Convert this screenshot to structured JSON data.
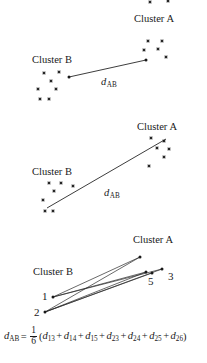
{
  "figure": {
    "title": "",
    "background_color": "#ffffff",
    "ink_color": "#1a1a1a",
    "width": 207,
    "height": 363
  },
  "panels": [
    {
      "id": "panel-single-linkage",
      "cluster_a_label": "Cluster A",
      "cluster_b_label": "Cluster B",
      "distance_symbol": "d",
      "distance_subscript": "AB",
      "linkage_type": "nearest-neighbour",
      "cluster_a_points": [
        {
          "x": 148,
          "y": 41
        },
        {
          "x": 162,
          "y": 41
        },
        {
          "x": 144,
          "y": 50
        },
        {
          "x": 158,
          "y": 49
        },
        {
          "x": 166,
          "y": 57
        }
      ],
      "cluster_b_points": [
        {
          "x": 44,
          "y": 73
        },
        {
          "x": 59,
          "y": 72
        },
        {
          "x": 51,
          "y": 81
        },
        {
          "x": 38,
          "y": 89
        },
        {
          "x": 56,
          "y": 89
        },
        {
          "x": 40,
          "y": 99
        },
        {
          "x": 49,
          "y": 99
        }
      ],
      "links": [
        {
          "from": {
            "x": 69,
            "y": 77
          },
          "to": {
            "x": 146,
            "y": 60
          }
        }
      ],
      "label_positions": {
        "cluster_a": {
          "x": 134,
          "y": 22
        },
        "cluster_b": {
          "x": 32,
          "y": 63
        },
        "distance": {
          "x": 101,
          "y": 85
        }
      }
    },
    {
      "id": "panel-complete-linkage",
      "cluster_a_label": "Cluster A",
      "cluster_b_label": "Cluster B",
      "distance_symbol": "d",
      "distance_subscript": "AB",
      "linkage_type": "furthest-neighbour",
      "cluster_a_points": [
        {
          "x": 151,
          "y": 138
        },
        {
          "x": 164,
          "y": 141
        },
        {
          "x": 157,
          "y": 148
        },
        {
          "x": 169,
          "y": 149
        },
        {
          "x": 164,
          "y": 157
        },
        {
          "x": 149,
          "y": 166
        }
      ],
      "cluster_b_points": [
        {
          "x": 49,
          "y": 183
        },
        {
          "x": 61,
          "y": 183
        },
        {
          "x": 73,
          "y": 186
        },
        {
          "x": 54,
          "y": 191
        },
        {
          "x": 43,
          "y": 200
        },
        {
          "x": 45,
          "y": 211
        },
        {
          "x": 53,
          "y": 211
        }
      ],
      "links": [
        {
          "from": {
            "x": 47,
            "y": 208
          },
          "to": {
            "x": 166,
            "y": 139
          }
        }
      ],
      "label_positions": {
        "cluster_a": {
          "x": 137,
          "y": 130
        },
        "cluster_b": {
          "x": 32,
          "y": 175
        },
        "distance": {
          "x": 104,
          "y": 196
        }
      }
    },
    {
      "id": "panel-average-linkage",
      "cluster_a_label": "Cluster A",
      "cluster_b_label": "Cluster B",
      "linkage_type": "average-linkage",
      "cluster_a_points": [
        {
          "id": "3",
          "x": 162,
          "y": 269
        },
        {
          "id": "4",
          "x": 140,
          "y": 257
        },
        {
          "id": "5",
          "x": 146,
          "y": 272
        },
        {
          "id": "6",
          "x": 152,
          "y": 273
        }
      ],
      "cluster_b_points": [
        {
          "id": "1",
          "x": 53,
          "y": 297
        },
        {
          "id": "2",
          "x": 45,
          "y": 312
        }
      ],
      "point_labels": [
        {
          "text": "1",
          "x": 42,
          "y": 300
        },
        {
          "text": "2",
          "x": 34,
          "y": 316
        },
        {
          "text": "3",
          "x": 168,
          "y": 280
        },
        {
          "text": "5",
          "x": 148,
          "y": 285
        }
      ],
      "links": [
        {
          "from_id": "1",
          "to_id": "3",
          "from": {
            "x": 53,
            "y": 297
          },
          "to": {
            "x": 162,
            "y": 269
          }
        },
        {
          "from_id": "1",
          "to_id": "4",
          "from": {
            "x": 53,
            "y": 297
          },
          "to": {
            "x": 140,
            "y": 257
          }
        },
        {
          "from_id": "1",
          "to_id": "5",
          "from": {
            "x": 53,
            "y": 297
          },
          "to": {
            "x": 146,
            "y": 272
          }
        },
        {
          "from_id": "2",
          "to_id": "3",
          "from": {
            "x": 45,
            "y": 312
          },
          "to": {
            "x": 162,
            "y": 269
          }
        },
        {
          "from_id": "2",
          "to_id": "4",
          "from": {
            "x": 45,
            "y": 312
          },
          "to": {
            "x": 140,
            "y": 257
          }
        },
        {
          "from_id": "2",
          "to_id": "5",
          "from": {
            "x": 45,
            "y": 312
          },
          "to": {
            "x": 146,
            "y": 272
          }
        },
        {
          "from_id": "2",
          "to_id": "6",
          "from": {
            "x": 45,
            "y": 312
          },
          "to": {
            "x": 152,
            "y": 273
          }
        }
      ],
      "label_positions": {
        "cluster_a": {
          "x": 133,
          "y": 243
        },
        "cluster_b": {
          "x": 33,
          "y": 275
        }
      }
    }
  ],
  "formula": {
    "lhs_symbol": "d",
    "lhs_subscript": "AB",
    "equals": "=",
    "fraction_numerator": "1",
    "fraction_denominator": "6",
    "open_paren": "(",
    "close_paren": ")",
    "terms": [
      {
        "symbol": "d",
        "subscript": "13"
      },
      {
        "symbol": "d",
        "subscript": "14"
      },
      {
        "symbol": "d",
        "subscript": "15"
      },
      {
        "symbol": "d",
        "subscript": "23"
      },
      {
        "symbol": "d",
        "subscript": "24"
      },
      {
        "symbol": "d",
        "subscript": "25"
      },
      {
        "symbol": "d",
        "subscript": "26"
      }
    ],
    "operator": "+",
    "full_text": "d_AB = 1/6 (d_13 + d_14 + d_15 + d_23 + d_24 + d_25 + d_26)"
  }
}
